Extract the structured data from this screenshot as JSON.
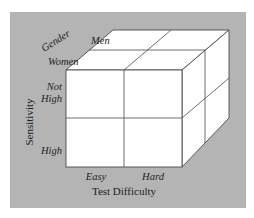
{
  "diagram": {
    "type": "3D cube (2x2x2 factorial design)",
    "colors": {
      "panel": "#b4b4b4",
      "cube_face": "#ffffff",
      "edge": "#4a4a4a"
    },
    "axes": {
      "depth": {
        "title": "Gender",
        "levels": [
          "Men",
          "Women"
        ]
      },
      "vertical": {
        "title": "Sensitivity",
        "levels": [
          "Not High",
          "High"
        ],
        "level_lines": [
          [
            "Not",
            "High"
          ],
          [
            "High"
          ]
        ]
      },
      "horizontal": {
        "title": "Test Difficulty",
        "levels": [
          "Easy",
          "Hard"
        ]
      }
    }
  }
}
